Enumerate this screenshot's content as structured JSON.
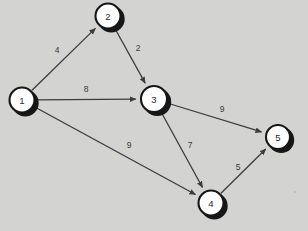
{
  "figure": {
    "kind": "directed-weighted-graph",
    "background_color": "#d3d3d2",
    "node_fill_color": "#ffffff",
    "node_stroke_color": "#161616",
    "node_shadow_color": "#171717",
    "edge_color": "#3c3c3c",
    "label_color": "#3a3a3a",
    "width": 308,
    "height": 231
  },
  "nodes": [
    {
      "id": "1",
      "label": "1",
      "cx": 22,
      "cy": 100,
      "r": 13.5
    },
    {
      "id": "2",
      "label": "2",
      "cx": 108,
      "cy": 16,
      "r": 13.5
    },
    {
      "id": "3",
      "label": "3",
      "cx": 154,
      "cy": 99,
      "r": 14.0
    },
    {
      "id": "4",
      "label": "4",
      "cx": 211,
      "cy": 203,
      "r": 13.5
    },
    {
      "id": "5",
      "label": "5",
      "cx": 278,
      "cy": 137,
      "r": 13.0
    }
  ],
  "edges": [
    {
      "id": "e1-2",
      "from": "1",
      "to": "2",
      "weight": "4",
      "label_x": 57,
      "label_y": 50,
      "directed": true
    },
    {
      "id": "e2-3",
      "from": "2",
      "to": "3",
      "weight": "2",
      "label_x": 138,
      "label_y": 48,
      "directed": true
    },
    {
      "id": "e1-3",
      "from": "1",
      "to": "3",
      "weight": "8",
      "label_x": 86,
      "label_y": 89,
      "directed": true
    },
    {
      "id": "e1-4",
      "from": "1",
      "to": "4",
      "weight": "9",
      "label_x": 129,
      "label_y": 145,
      "directed": true
    },
    {
      "id": "e3-5",
      "from": "3",
      "to": "5",
      "weight": "9",
      "label_x": 222,
      "label_y": 109,
      "directed": true
    },
    {
      "id": "e3-4",
      "from": "3",
      "to": "4",
      "weight": "7",
      "label_x": 190,
      "label_y": 145,
      "directed": true
    },
    {
      "id": "e4-5",
      "from": "4",
      "to": "5",
      "weight": "5",
      "label_x": 238,
      "label_y": 167,
      "directed": true
    }
  ]
}
